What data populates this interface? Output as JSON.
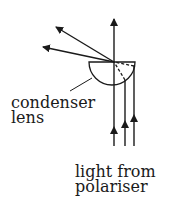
{
  "diagram": {
    "labels": {
      "condenser_line1": "condenser",
      "condenser_line2": "lens",
      "source_line1": "light from",
      "source_line2": "polariser"
    },
    "colors": {
      "ink": "#1a1a1a",
      "background": "#ffffff"
    },
    "elements": [
      "condenser-lens",
      "incoming-parallel-rays",
      "refracted-rays",
      "focus-point"
    ]
  }
}
